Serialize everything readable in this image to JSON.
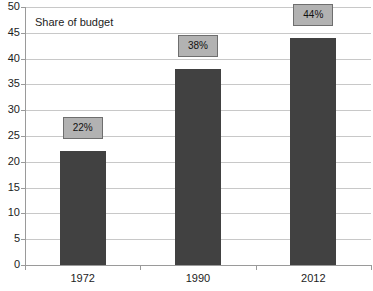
{
  "chart_data": {
    "type": "bar",
    "title": "",
    "series_caption": "Share of budget",
    "categories": [
      "1972",
      "1990",
      "2012"
    ],
    "values": [
      22,
      38,
      44
    ],
    "data_labels": [
      "22%",
      "38%",
      "44%"
    ],
    "xlabel": "",
    "ylabel": "",
    "ylim": [
      0,
      50
    ],
    "y_ticks": [
      0,
      5,
      10,
      15,
      20,
      25,
      30,
      35,
      40,
      45,
      50
    ],
    "y_tick_labels": [
      "0",
      "5",
      "10",
      "15",
      "20",
      "25",
      "30",
      "35",
      "40",
      "45",
      "50"
    ],
    "grid": true,
    "legend": "none",
    "colors": {
      "bar": "#414141",
      "label_box_fill": "#b2b2b2",
      "label_box_border": "#6e6e6e",
      "gridline": "#c8c8c8",
      "axis": "#9a9a9a",
      "text": "#1c1c1c",
      "background": "#ffffff"
    }
  }
}
